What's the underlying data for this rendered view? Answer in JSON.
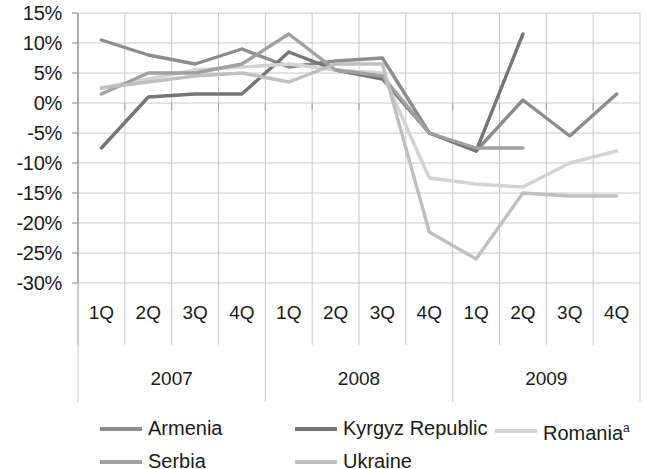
{
  "chart_data": {
    "type": "line",
    "title": "",
    "xlabel": "",
    "ylabel": "",
    "ylim": [
      -30,
      15
    ],
    "ytick_step": 5,
    "grid": true,
    "legend_position": "bottom",
    "ytick_labels": [
      "15%",
      "10%",
      "5%",
      "0%",
      "-5%",
      "-10%",
      "-15%",
      "-20%",
      "-25%",
      "-30%"
    ],
    "ytick_values": [
      15,
      10,
      5,
      0,
      -5,
      -10,
      -15,
      -20,
      -25,
      -30
    ],
    "categories": [
      "1Q",
      "2Q",
      "3Q",
      "4Q",
      "1Q",
      "2Q",
      "3Q",
      "4Q",
      "1Q",
      "2Q",
      "3Q",
      "4Q"
    ],
    "group_labels": [
      "2007",
      "2008",
      "2009"
    ],
    "group_spans": [
      4,
      4,
      4
    ],
    "series": [
      {
        "name": "Armenia",
        "color": "#8c8c8c",
        "values": [
          10.5,
          8.0,
          6.5,
          9.0,
          6.0,
          7.0,
          7.5,
          -5.0,
          -8.0,
          0.5,
          -5.5,
          1.5
        ]
      },
      {
        "name": "Kyrgyz Republic",
        "color": "#757575",
        "values": [
          -7.5,
          1.0,
          1.5,
          1.5,
          8.5,
          5.5,
          4.0,
          -5.0,
          -8.0,
          11.5,
          null,
          null
        ]
      },
      {
        "name": "Romania",
        "superscript": "a",
        "color": "#d3d3d3",
        "values": [
          2.5,
          4.0,
          5.5,
          6.0,
          6.5,
          5.5,
          5.0,
          -12.5,
          -13.5,
          -14.0,
          -10.0,
          -8.0
        ]
      },
      {
        "name": "Serbia",
        "color": "#a0a0a0",
        "values": [
          1.5,
          5.0,
          5.0,
          6.5,
          11.5,
          5.5,
          4.5,
          -5.0,
          -7.5,
          -7.5,
          null,
          null
        ]
      },
      {
        "name": "Ukraine",
        "color": "#bfbfbf",
        "values": [
          2.5,
          3.5,
          4.5,
          5.0,
          3.5,
          6.5,
          6.5,
          -21.5,
          -26.0,
          -15.0,
          -15.5,
          -15.5
        ]
      }
    ]
  },
  "legend": {
    "items": [
      {
        "label": "Armenia",
        "sup": ""
      },
      {
        "label": "Kyrgyz Republic",
        "sup": ""
      },
      {
        "label": "Romania",
        "sup": "a"
      },
      {
        "label": "Serbia",
        "sup": ""
      },
      {
        "label": "Ukraine",
        "sup": ""
      }
    ]
  },
  "axis": {
    "plot_left": 78,
    "plot_right": 640,
    "plot_top": 13,
    "plot_bottom": 283,
    "category_band_bottom": 345,
    "group_band_bottom": 402
  },
  "colors": {
    "grid": "#c9c9c9",
    "axis": "#9a9a9a",
    "text": "#1b1b1b",
    "background": "#ffffff"
  }
}
